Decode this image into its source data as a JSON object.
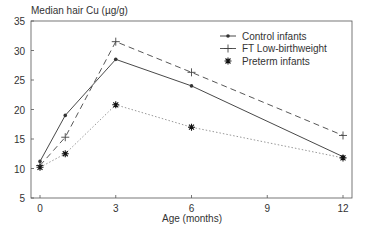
{
  "chart_data": {
    "type": "line",
    "title": "",
    "ylabel": "Median hair Cu (µg/g)",
    "xlabel": "Age (months)",
    "xlim": [
      -0.3,
      12.3
    ],
    "ylim": [
      5,
      35
    ],
    "xticks": [
      0,
      3,
      6,
      9,
      12
    ],
    "yticks": [
      5,
      10,
      15,
      20,
      25,
      30,
      35
    ],
    "grid": false,
    "legend_position": "upper right",
    "series": [
      {
        "name": "Control infants",
        "marker": "dot",
        "line": "solid",
        "color": "#333333",
        "x": [
          0,
          1,
          3,
          6,
          12
        ],
        "y": [
          11.2,
          19.0,
          28.5,
          24.0,
          12.0
        ]
      },
      {
        "name": "FT Low-birthweight",
        "marker": "plus",
        "line": "dashed",
        "color": "#444444",
        "x": [
          0,
          1,
          3,
          6,
          12
        ],
        "y": [
          10.5,
          15.3,
          31.5,
          26.3,
          15.6
        ]
      },
      {
        "name": "Preterm infants",
        "marker": "asterisk",
        "line": "dotted",
        "color": "#999999",
        "x": [
          0,
          1,
          3,
          6,
          12
        ],
        "y": [
          10.2,
          12.5,
          20.8,
          17.0,
          11.8
        ]
      }
    ]
  }
}
